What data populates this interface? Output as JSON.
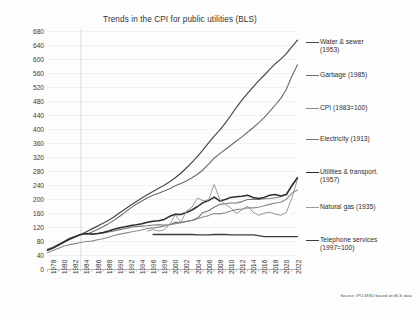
{
  "chart_data": {
    "type": "line",
    "title": "Trends in the CPI for public utilities (BLS)",
    "xlabel": "",
    "ylabel": "",
    "xlim": [
      1978,
      2023
    ],
    "ylim": [
      0,
      680
    ],
    "ytick_step": 40,
    "grid": true,
    "legend_position": "right",
    "source": "Source: IPU-MSU based on BLS data",
    "yticks": [
      0,
      40,
      80,
      120,
      160,
      200,
      240,
      280,
      320,
      360,
      400,
      440,
      480,
      520,
      560,
      600,
      640,
      680
    ],
    "xticks": [
      1978,
      1980,
      1982,
      1984,
      1986,
      1988,
      1990,
      1992,
      1994,
      1996,
      1998,
      2000,
      2002,
      2004,
      2006,
      2008,
      2010,
      2012,
      2014,
      2016,
      2018,
      2020,
      2022
    ],
    "x": [
      1978,
      1979,
      1980,
      1981,
      1982,
      1983,
      1984,
      1985,
      1986,
      1987,
      1988,
      1989,
      1990,
      1991,
      1992,
      1993,
      1994,
      1995,
      1996,
      1997,
      1998,
      1999,
      2000,
      2001,
      2002,
      2003,
      2004,
      2005,
      2006,
      2007,
      2008,
      2009,
      2010,
      2011,
      2012,
      2013,
      2014,
      2015,
      2016,
      2017,
      2018,
      2019,
      2020,
      2021,
      2022,
      2023
    ],
    "series": [
      {
        "name": "Water & sewer (1953)",
        "color": "#4a4a4a",
        "width": 1.2,
        "values": [
          57,
          63,
          70,
          78,
          86,
          93,
          100,
          108,
          116,
          124,
          132,
          141,
          151,
          162,
          173,
          184,
          194,
          204,
          214,
          223,
          232,
          241,
          251,
          262,
          275,
          290,
          306,
          323,
          342,
          362,
          381,
          398,
          418,
          440,
          463,
          484,
          503,
          521,
          539,
          555,
          572,
          588,
          601,
          617,
          637,
          655
        ]
      },
      {
        "name": "Garbage (1985)",
        "color": "#6b6b6b",
        "width": 1.1,
        "values": [
          null,
          null,
          null,
          null,
          null,
          null,
          null,
          100,
          107,
          114,
          122,
          131,
          141,
          152,
          164,
          176,
          187,
          196,
          205,
          212,
          218,
          224,
          231,
          239,
          246,
          253,
          262,
          272,
          285,
          301,
          318,
          331,
          343,
          355,
          367,
          379,
          392,
          405,
          419,
          434,
          452,
          470,
          489,
          515,
          553,
          585
        ]
      },
      {
        "name": "CPI (1983=100)",
        "color": "#8a8a8a",
        "width": 1.1,
        "values": [
          48,
          54,
          61,
          67,
          71,
          74,
          77,
          80,
          81,
          85,
          88,
          92,
          97,
          101,
          104,
          107,
          110,
          113,
          117,
          119,
          121,
          124,
          128,
          131,
          134,
          137,
          140,
          145,
          150,
          154,
          160,
          159,
          162,
          167,
          171,
          173,
          176,
          176,
          178,
          182,
          186,
          190,
          192,
          201,
          218,
          227
        ]
      },
      {
        "name": "Electricity (1913)",
        "color": "#777777",
        "width": 1.1,
        "values": [
          58,
          64,
          72,
          81,
          89,
          95,
          100,
          103,
          102,
          102,
          104,
          107,
          110,
          114,
          117,
          121,
          123,
          124,
          125,
          127,
          128,
          127,
          128,
          135,
          134,
          137,
          140,
          147,
          163,
          168,
          178,
          186,
          188,
          190,
          190,
          194,
          200,
          201,
          200,
          202,
          203,
          205,
          208,
          216,
          239,
          263
        ]
      },
      {
        "name": "Utilities & transport. (1957)",
        "color": "#2e2e2e",
        "width": 1.5,
        "values": [
          55,
          61,
          70,
          79,
          88,
          94,
          100,
          103,
          101,
          103,
          106,
          110,
          115,
          119,
          122,
          126,
          128,
          131,
          135,
          138,
          139,
          143,
          152,
          158,
          157,
          163,
          170,
          180,
          191,
          197,
          207,
          196,
          200,
          206,
          208,
          209,
          212,
          206,
          203,
          206,
          212,
          214,
          210,
          214,
          240,
          262
        ]
      },
      {
        "name": "Natural gas (1935)",
        "color": "#9a9a9a",
        "width": 1.0,
        "values": [
          null,
          null,
          null,
          null,
          null,
          null,
          null,
          null,
          null,
          null,
          null,
          null,
          null,
          null,
          null,
          null,
          null,
          null,
          110,
          114,
          110,
          113,
          129,
          156,
          135,
          167,
          178,
          204,
          196,
          199,
          243,
          200,
          186,
          176,
          160,
          170,
          181,
          164,
          155,
          161,
          164,
          158,
          155,
          163,
          205,
          258
        ]
      },
      {
        "name": "Telephone services (1997=100)",
        "color": "#3c3c3c",
        "width": 1.3,
        "values": [
          null,
          null,
          null,
          null,
          null,
          null,
          null,
          null,
          null,
          null,
          null,
          null,
          null,
          null,
          null,
          null,
          null,
          null,
          null,
          100,
          100,
          100,
          100,
          100,
          100,
          100,
          100,
          99,
          99,
          99,
          100,
          100,
          100,
          99,
          99,
          99,
          99,
          99,
          97,
          94,
          94,
          94,
          94,
          94,
          94,
          94
        ]
      }
    ]
  },
  "legend": {
    "items": [
      {
        "label": "Water & sewer\n(1953)",
        "color": "#4a4a4a",
        "top": 38
      },
      {
        "label": "Garbage (1985)",
        "color": "#6b6b6b",
        "top": 71
      },
      {
        "label": "CPI (1983=100)",
        "color": "#8a8a8a",
        "top": 104
      },
      {
        "label": "Electricity (1913)",
        "color": "#777777",
        "top": 135
      },
      {
        "label": "Utilities & transport.\n(1957)",
        "color": "#2e2e2e",
        "top": 168
      },
      {
        "label": "Natural gas (1935)",
        "color": "#9a9a9a",
        "top": 203
      },
      {
        "label": "Telephone services\n(1997=100)",
        "color": "#3c3c3c",
        "top": 236
      }
    ]
  },
  "axes": {
    "ytick_labels": [
      "680",
      "640",
      "600",
      "560",
      "520",
      "480",
      "440",
      "400",
      "360",
      "320",
      "280",
      "240",
      "200",
      "160",
      "120",
      "80",
      "40",
      "0"
    ],
    "xtick_labels": [
      "1978",
      "1980",
      "1982",
      "1984",
      "1986",
      "1988",
      "1990",
      "1992",
      "1994",
      "1996",
      "1998",
      "2000",
      "2002",
      "2004",
      "2006",
      "2008",
      "2010",
      "2012",
      "2014",
      "2016",
      "2018",
      "2020",
      "2022"
    ]
  },
  "title": "Trends in the CPI for public utilities (BLS)",
  "source_note": "Source: IPU-MSU based on BLS data"
}
